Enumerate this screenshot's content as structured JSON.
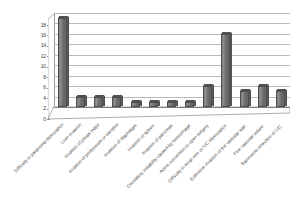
{
  "chart_data": {
    "type": "bar",
    "title": "",
    "subtitle": "",
    "xlabel": "",
    "ylabel": "",
    "ylim": [
      0,
      18
    ],
    "ytick_step": 2,
    "yticks": [
      "0",
      "2",
      "4",
      "6",
      "8",
      "10",
      "12",
      "14",
      "16",
      "18"
    ],
    "grid": true,
    "legend": false,
    "orientation": "vertical",
    "style": "3d-column",
    "bar_color": "#6e6e6e",
    "categories": [
      "Difficulty in paranoma dissociation",
      "Liver invasion",
      "Invasion of psoas major",
      "Invasion of peritoneum or intestine",
      "Invasion of diaphragm",
      "Invasion of spleen",
      "Invasion of pancreas",
      "Circulatory instability caused by hemorrhage",
      "Active conversion to open surgery",
      "Difficulty in renal vein or IVC dissociation",
      "Extensive invasion of the vascular wall",
      "Fine vascular suture",
      "Transverse resection of IVC"
    ],
    "values": [
      17,
      2,
      2,
      2,
      1,
      1,
      1,
      1,
      4,
      14,
      3,
      4,
      3
    ]
  }
}
